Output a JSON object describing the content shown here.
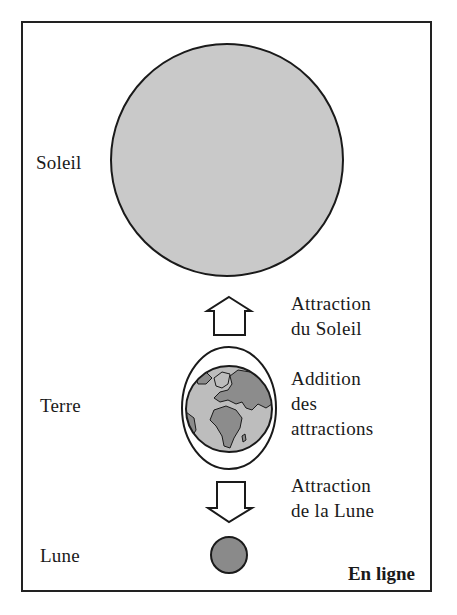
{
  "bodies": {
    "sun": {
      "label": "Soleil",
      "fill": "#c9c9c9"
    },
    "earth": {
      "label": "Terre",
      "ocean": "#bdbdbd",
      "land": "#8c8c8c"
    },
    "moon": {
      "label": "Lune",
      "fill": "#8a8a8a"
    }
  },
  "annotations": {
    "sun_attraction": {
      "line1": "Attraction",
      "line2": "du Soleil"
    },
    "sum": {
      "line1": "Addition",
      "line2": "des",
      "line3": "attractions"
    },
    "moon_attraction": {
      "line1": "Attraction",
      "line2": "de la Lune"
    }
  },
  "arrows": {
    "up": {
      "direction": "up",
      "meaning": "toward Sun"
    },
    "down": {
      "direction": "down",
      "meaning": "toward Moon"
    }
  },
  "configuration": {
    "label": "En ligne"
  }
}
